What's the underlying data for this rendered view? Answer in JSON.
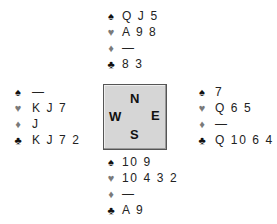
{
  "diagram": {
    "type": "bridge-deal",
    "compass": {
      "north": "N",
      "south": "S",
      "east": "E",
      "west": "W"
    },
    "suit_icons": {
      "spades": "♠",
      "hearts": "♥",
      "diamonds": "♦",
      "clubs": "♣"
    },
    "colors": {
      "black_suit": "#111111",
      "red_suit": "#7a7a7a",
      "compass_fill": "#d6d6d6"
    },
    "hands": {
      "north": {
        "spades": "Q J 5",
        "hearts": "A 9 8",
        "diamonds": "—",
        "clubs": "8 3"
      },
      "west": {
        "spades": "—",
        "hearts": "K J 7",
        "diamonds": "J",
        "clubs": "K J 7 2"
      },
      "east": {
        "spades": "7",
        "hearts": "Q 6 5",
        "diamonds": "—",
        "clubs": "Q 10 6 4"
      },
      "south": {
        "spades": "10 9",
        "hearts": "10 4 3 2",
        "diamonds": "—",
        "clubs": "A 9"
      }
    }
  }
}
